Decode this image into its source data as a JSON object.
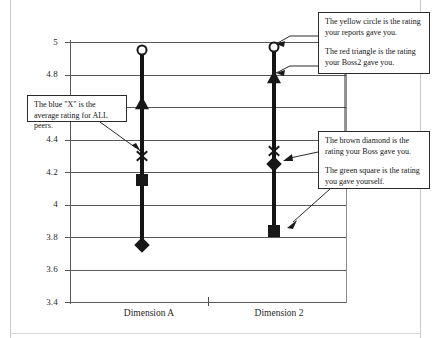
{
  "chart_data": {
    "type": "scatter",
    "title": "",
    "xlabel": "",
    "ylabel": "",
    "ylim": [
      3.4,
      5.0
    ],
    "ytick_values": [
      5,
      4.8,
      4.6,
      4.4,
      4.2,
      4,
      3.8,
      3.6,
      3.4
    ],
    "ytick_labels": [
      "5",
      "4.8",
      "4.6",
      "4.4",
      "4.2",
      "4",
      "3.8",
      "3.6",
      "3.4"
    ],
    "hidden_ytick_labels": [
      "4.6"
    ],
    "grid": true,
    "legend_position": "none",
    "categories": [
      "Dimension A",
      "Dimension 2"
    ],
    "series": [
      {
        "name": "Reports rating",
        "marker": "circle",
        "color": "#ffcc00",
        "color_name": "yellow",
        "values": [
          4.95,
          4.97
        ]
      },
      {
        "name": "Boss2 rating",
        "marker": "triangle",
        "color": "#cc2020",
        "color_name": "red",
        "values": [
          4.62,
          4.78
        ]
      },
      {
        "name": "Average rating for ALL peers",
        "marker": "x",
        "color": "#2046cc",
        "color_name": "blue",
        "values": [
          4.3,
          4.33
        ]
      },
      {
        "name": "Boss rating",
        "marker": "diamond",
        "color": "#8b5a2b",
        "color_name": "brown",
        "values": [
          3.75,
          4.25
        ]
      },
      {
        "name": "Self rating",
        "marker": "square",
        "color": "#2e8b2e",
        "color_name": "green",
        "values": [
          4.15,
          3.84
        ]
      }
    ],
    "range_bars": [
      {
        "category": "Dimension A",
        "low": 3.75,
        "high": 4.95
      },
      {
        "category": "Dimension 2",
        "low": 3.84,
        "high": 4.97
      }
    ]
  },
  "callouts": {
    "top_right": {
      "line1": "The yellow circle is the rating your reports gave you.",
      "line2": "The red triangle is the rating your Boss2 gave you."
    },
    "mid_right": {
      "line1": "The brown diamond is the rating your Boss gave you.",
      "line2": "The green square is the rating you gave yourself."
    },
    "left": {
      "line1": "The blue \"X\" is the average rating for ALL peers."
    }
  }
}
